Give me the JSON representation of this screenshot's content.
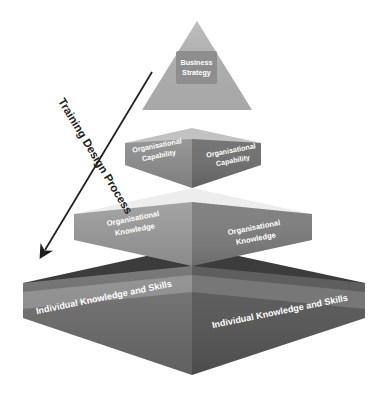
{
  "diagram": {
    "process_arrow": {
      "label": "Training Design Process",
      "direction": "downward",
      "color": "#1d1d1d"
    },
    "apex": {
      "label_line1": "Business",
      "label_line2": "Strategy",
      "face_color": "#b3b3b3",
      "box_color": "#8e8e8e",
      "text_color": "#ffffff"
    },
    "tiers": [
      {
        "name": "organisational-capability",
        "label": "Organisational Capability",
        "label_line1": "Organisational",
        "label_line2": "Capability",
        "left_face_color": "#8c8c8c",
        "right_face_color": "#6f6f6f",
        "top_slab_color": "#c2c2c2",
        "text_color": "#ffffff"
      },
      {
        "name": "organisational-knowledge",
        "label": "Organisational Knowledge",
        "label_line1": "Organisational",
        "label_line2": "Knowledge",
        "left_face_color": "#9a9a9a",
        "right_face_color": "#7d7d7d",
        "top_slab_color": "#ededed",
        "text_color": "#ffffff"
      },
      {
        "name": "individual-knowledge-and-skills",
        "label": "Individual Knowledge and Skills",
        "label_line1": "Individual Knowledge and Skills",
        "label_line2": "",
        "left_face_color": "#6b6b6b",
        "right_face_color": "#575757",
        "top_slab_color": "#3c3c3c",
        "text_color": "#ffffff"
      }
    ],
    "background_color": "#ffffff"
  }
}
